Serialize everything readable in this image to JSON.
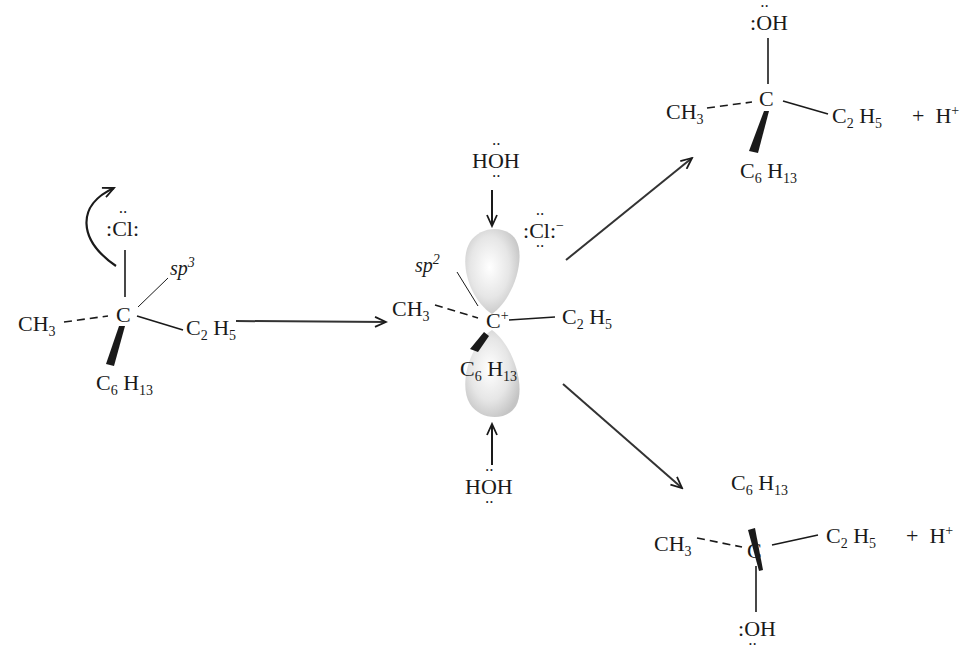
{
  "reactant": {
    "leaving_group": ":Cl:",
    "leaving_group_atom": "Cl",
    "center": "C",
    "hybridization": "sp3",
    "substituents": {
      "left": "CH3",
      "right": "C2H5",
      "bottom": "C6H13"
    }
  },
  "intermediate": {
    "center": "C+",
    "hybridization": "sp2",
    "counter_ion": ":Cl:-",
    "nucleophile_top": "HÖH",
    "nucleophile_bottom": "HÖH",
    "substituents": {
      "left": "CH3",
      "right": "C2H5",
      "bottom": "C6H13"
    }
  },
  "product_top": {
    "top": ":ÖH",
    "center": "C",
    "substituents": {
      "left": "CH3",
      "right": "C2H5",
      "wedge": "C6H13"
    },
    "byproduct": "+ H+"
  },
  "product_bottom": {
    "bottom": ":ÖH",
    "center": "C",
    "substituents": {
      "left": "CH3",
      "right": "C2H5",
      "wedge": "C6H13"
    },
    "byproduct": "+ H+"
  },
  "labels": {
    "sp": "sp",
    "sp3_exp": "3",
    "sp2_exp": "2",
    "C": "C",
    "H": "H",
    "O": "O",
    "Cl": "Cl",
    "CH": "CH",
    "n3": "3",
    "n2": "2",
    "n5": "5",
    "n6": "6",
    "n13": "13",
    "plus": "+",
    "minus": "−",
    "plus_h": "+",
    "dots": "··",
    "colon": ":"
  },
  "colors": {
    "ink": "#1a1a1a",
    "orbital": "#d8d8d8",
    "background": "#ffffff"
  }
}
